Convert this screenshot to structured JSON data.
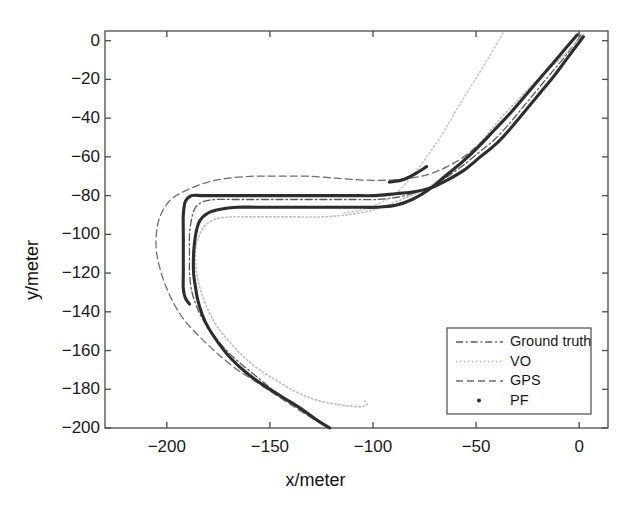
{
  "figure": {
    "title": "",
    "xlabel": "x/meter",
    "ylabel": "y/meter"
  },
  "axes": {
    "x_ticks": [
      "-200",
      "-150",
      "-100",
      "-50",
      "0"
    ],
    "y_ticks": [
      "0",
      "-20",
      "-40",
      "-60",
      "-80",
      "-100",
      "-120",
      "-140",
      "-160",
      "-180",
      "-200"
    ],
    "xlim": [
      -230,
      14
    ],
    "ylim": [
      -200,
      5
    ],
    "box": true,
    "grid": false
  },
  "legend": {
    "position": "lower-right",
    "entries": [
      {
        "label": "Ground truth",
        "style": "dashdot",
        "color": "#5a5a5a"
      },
      {
        "label": "VO",
        "style": "dotted",
        "color": "#b9b9b9"
      },
      {
        "label": "GPS",
        "style": "dashed",
        "color": "#6e6e6e"
      },
      {
        "label": "PF",
        "style": "marker-dot",
        "color": "#2d2d2d"
      }
    ]
  },
  "colors": {
    "axis": "#4a4a4a",
    "text": "#1a1a1a",
    "ground_truth": "#5a5a5a",
    "vo": "#bdbdbd",
    "gps": "#6e6e6e",
    "pf": "#2d2d2d",
    "background": "#ffffff"
  },
  "chart_data": {
    "type": "line",
    "title": "",
    "xlabel": "x/meter",
    "ylabel": "y/meter",
    "xlim": [
      -230,
      14
    ],
    "ylim": [
      -200,
      5
    ],
    "grid": false,
    "legend_position": "lower-right",
    "series": [
      {
        "name": "Ground truth",
        "style": "dashdot",
        "color": "#5a5a5a",
        "points": [
          [
            1,
            3
          ],
          [
            -6,
            -7
          ],
          [
            -13,
            -16
          ],
          [
            -20,
            -25
          ],
          [
            -27,
            -34
          ],
          [
            -34,
            -43
          ],
          [
            -41,
            -51
          ],
          [
            -49,
            -58
          ],
          [
            -57,
            -65
          ],
          [
            -65,
            -71
          ],
          [
            -73,
            -76
          ],
          [
            -81,
            -79
          ],
          [
            -89,
            -81
          ],
          [
            -98,
            -82
          ],
          [
            -110,
            -82
          ],
          [
            -122,
            -82
          ],
          [
            -134,
            -82
          ],
          [
            -146,
            -82
          ],
          [
            -158,
            -82
          ],
          [
            -168,
            -82
          ],
          [
            -176,
            -82
          ],
          [
            -182,
            -83
          ],
          [
            -186,
            -86
          ],
          [
            -188,
            -92
          ],
          [
            -189,
            -100
          ],
          [
            -189,
            -110
          ],
          [
            -189,
            -120
          ],
          [
            -188,
            -129
          ],
          [
            -186,
            -136
          ],
          [
            -183,
            -143
          ],
          [
            -178,
            -151
          ],
          [
            -172,
            -159
          ],
          [
            -165,
            -166
          ],
          [
            -157,
            -173
          ],
          [
            -149,
            -180
          ],
          [
            -141,
            -186
          ],
          [
            -133,
            -192
          ],
          [
            -126,
            -197
          ],
          [
            -121,
            -200
          ]
        ]
      },
      {
        "name": "VO",
        "style": "dotted",
        "color": "#bdbdbd",
        "points": [
          [
            2,
            3
          ],
          [
            -6,
            -6
          ],
          [
            -14,
            -14
          ],
          [
            -22,
            -22
          ],
          [
            -30,
            -31
          ],
          [
            -38,
            -40
          ],
          [
            -45,
            -49
          ],
          [
            -52,
            -57
          ],
          [
            -59,
            -64
          ],
          [
            -67,
            -71
          ],
          [
            -75,
            -77
          ],
          [
            -84,
            -81
          ],
          [
            -93,
            -85
          ],
          [
            -102,
            -88
          ],
          [
            -113,
            -90
          ],
          [
            -125,
            -91
          ],
          [
            -137,
            -91
          ],
          [
            -149,
            -91
          ],
          [
            -160,
            -91
          ],
          [
            -169,
            -91
          ],
          [
            -176,
            -92
          ],
          [
            -181,
            -95
          ],
          [
            -184,
            -100
          ],
          [
            -186,
            -107
          ],
          [
            -186,
            -115
          ],
          [
            -185,
            -123
          ],
          [
            -183,
            -131
          ],
          [
            -180,
            -139
          ],
          [
            -176,
            -147
          ],
          [
            -170,
            -155
          ],
          [
            -163,
            -163
          ],
          [
            -155,
            -170
          ],
          [
            -146,
            -176
          ],
          [
            -136,
            -182
          ],
          [
            -126,
            -186
          ],
          [
            -116,
            -188
          ],
          [
            -107,
            -189
          ],
          [
            -103,
            -188
          ],
          [
            -104,
            -186
          ]
        ]
      },
      {
        "name": "VO-upper-branch",
        "style": "dotted",
        "color": "#c9c9c9",
        "points": [
          [
            -37,
            4
          ],
          [
            -44,
            -9
          ],
          [
            -51,
            -21
          ],
          [
            -58,
            -33
          ],
          [
            -64,
            -44
          ],
          [
            -70,
            -54
          ],
          [
            -76,
            -63
          ],
          [
            -82,
            -71
          ],
          [
            -88,
            -78
          ],
          [
            -95,
            -83
          ],
          [
            -104,
            -87
          ],
          [
            -114,
            -89
          ]
        ]
      },
      {
        "name": "GPS",
        "style": "dashed",
        "color": "#6e6e6e",
        "points": [
          [
            0,
            4
          ],
          [
            -8,
            -6
          ],
          [
            -16,
            -16
          ],
          [
            -24,
            -26
          ],
          [
            -32,
            -36
          ],
          [
            -40,
            -45
          ],
          [
            -48,
            -53
          ],
          [
            -56,
            -60
          ],
          [
            -64,
            -65
          ],
          [
            -73,
            -69
          ],
          [
            -82,
            -71
          ],
          [
            -92,
            -72
          ],
          [
            -104,
            -72
          ],
          [
            -118,
            -71
          ],
          [
            -132,
            -70
          ],
          [
            -146,
            -70
          ],
          [
            -158,
            -70
          ],
          [
            -170,
            -71
          ],
          [
            -180,
            -73
          ],
          [
            -190,
            -77
          ],
          [
            -198,
            -82
          ],
          [
            -203,
            -90
          ],
          [
            -205,
            -99
          ],
          [
            -205,
            -109
          ],
          [
            -203,
            -119
          ],
          [
            -200,
            -128
          ],
          [
            -196,
            -137
          ],
          [
            -191,
            -145
          ],
          [
            -184,
            -153
          ],
          [
            -176,
            -161
          ],
          [
            -167,
            -169
          ],
          [
            -157,
            -176
          ],
          [
            -147,
            -183
          ],
          [
            -137,
            -190
          ],
          [
            -128,
            -196
          ],
          [
            -122,
            -200
          ]
        ]
      },
      {
        "name": "PF",
        "style": "solid-thick",
        "color": "#2d2d2d",
        "points": [
          [
            2,
            2
          ],
          [
            -5,
            -8
          ],
          [
            -12,
            -18
          ],
          [
            -19,
            -27
          ],
          [
            -26,
            -36
          ],
          [
            -33,
            -45
          ],
          [
            -40,
            -53
          ],
          [
            -48,
            -60
          ],
          [
            -56,
            -67
          ],
          [
            -64,
            -72
          ],
          [
            -72,
            -76
          ],
          [
            -80,
            -78
          ],
          [
            -89,
            -79
          ],
          [
            -99,
            -80
          ],
          [
            -111,
            -80
          ],
          [
            -123,
            -80
          ],
          [
            -135,
            -80
          ],
          [
            -147,
            -80
          ],
          [
            -159,
            -80
          ],
          [
            -169,
            -80
          ],
          [
            -177,
            -80
          ],
          [
            -183,
            -80
          ],
          [
            -188,
            -80
          ],
          [
            -191,
            -83
          ],
          [
            -192,
            -90
          ],
          [
            -192,
            -100
          ],
          [
            -192,
            -110
          ],
          [
            -192,
            -120
          ],
          [
            -192,
            -128
          ],
          [
            -191,
            -133
          ],
          [
            -189,
            -136
          ]
        ]
      },
      {
        "name": "PF-lower",
        "style": "solid-thick",
        "color": "#2d2d2d",
        "points": [
          [
            -1,
            3
          ],
          [
            -9,
            -7
          ],
          [
            -17,
            -17
          ],
          [
            -25,
            -27
          ],
          [
            -33,
            -37
          ],
          [
            -41,
            -46
          ],
          [
            -49,
            -55
          ],
          [
            -57,
            -63
          ],
          [
            -65,
            -70
          ],
          [
            -73,
            -77
          ],
          [
            -81,
            -82
          ],
          [
            -89,
            -85
          ],
          [
            -98,
            -86
          ],
          [
            -108,
            -86
          ],
          [
            -120,
            -86
          ],
          [
            -132,
            -86
          ],
          [
            -144,
            -86
          ],
          [
            -156,
            -86
          ],
          [
            -166,
            -86
          ],
          [
            -174,
            -87
          ],
          [
            -180,
            -89
          ],
          [
            -184,
            -93
          ],
          [
            -186,
            -100
          ],
          [
            -187,
            -110
          ],
          [
            -187,
            -120
          ],
          [
            -186,
            -128
          ],
          [
            -185,
            -134
          ],
          [
            -183,
            -141
          ],
          [
            -180,
            -148
          ],
          [
            -175,
            -156
          ],
          [
            -169,
            -164
          ],
          [
            -162,
            -171
          ],
          [
            -153,
            -178
          ],
          [
            -144,
            -184
          ],
          [
            -135,
            -190
          ],
          [
            -127,
            -196
          ],
          [
            -121,
            -200
          ]
        ]
      },
      {
        "name": "PF-upper-segment",
        "style": "solid-thick",
        "color": "#2d2d2d",
        "points": [
          [
            -74,
            -65
          ],
          [
            -80,
            -69
          ],
          [
            -86,
            -72
          ],
          [
            -92,
            -73
          ]
        ]
      }
    ]
  }
}
